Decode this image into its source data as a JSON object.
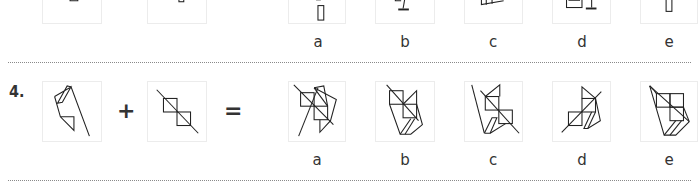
{
  "previous_question": {
    "option_labels": [
      "a",
      "b",
      "c",
      "d",
      "e"
    ]
  },
  "question": {
    "number": "4.",
    "operator_plus": "+",
    "operator_equals": "=",
    "option_labels": [
      "a",
      "b",
      "c",
      "d",
      "e"
    ]
  },
  "colors": {
    "line": "#222222",
    "box_border": "#ececec",
    "separator": "#8a8a8a"
  }
}
